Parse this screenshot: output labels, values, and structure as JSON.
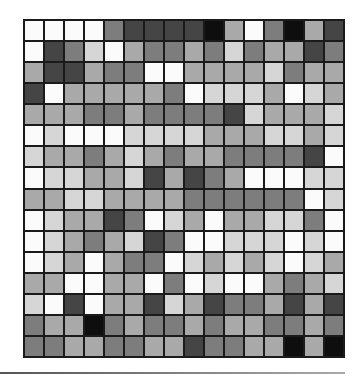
{
  "figure": {
    "rows": 16,
    "columns": 16,
    "shade_palette": [
      "#fbfbfb",
      "#d6d6d6",
      "#a9a9a9",
      "#7d7d7d",
      "#454545",
      "#0e0e0e"
    ],
    "grid_line_color": "#1a1a1a",
    "cells": [
      [
        0,
        0,
        0,
        0,
        3,
        4,
        4,
        4,
        4,
        5,
        2,
        0,
        3,
        5,
        2,
        4
      ],
      [
        0,
        4,
        3,
        1,
        0,
        2,
        3,
        3,
        2,
        3,
        1,
        3,
        2,
        2,
        4,
        3
      ],
      [
        2,
        4,
        4,
        2,
        3,
        3,
        0,
        0,
        2,
        2,
        2,
        2,
        1,
        3,
        2,
        2
      ],
      [
        4,
        0,
        2,
        2,
        2,
        2,
        2,
        3,
        0,
        1,
        1,
        1,
        2,
        0,
        1,
        2
      ],
      [
        2,
        2,
        2,
        3,
        3,
        2,
        3,
        3,
        3,
        3,
        4,
        1,
        2,
        2,
        2,
        1
      ],
      [
        0,
        1,
        0,
        0,
        0,
        1,
        1,
        1,
        1,
        2,
        2,
        2,
        1,
        1,
        2,
        1
      ],
      [
        1,
        2,
        2,
        3,
        2,
        1,
        2,
        3,
        2,
        2,
        3,
        3,
        3,
        3,
        4,
        0
      ],
      [
        0,
        1,
        1,
        2,
        2,
        1,
        4,
        2,
        4,
        3,
        2,
        0,
        0,
        0,
        1,
        1
      ],
      [
        2,
        2,
        1,
        1,
        2,
        2,
        2,
        2,
        3,
        3,
        3,
        3,
        3,
        3,
        0,
        1
      ],
      [
        0,
        1,
        2,
        2,
        4,
        3,
        0,
        1,
        2,
        0,
        2,
        2,
        1,
        1,
        3,
        0
      ],
      [
        0,
        1,
        2,
        3,
        2,
        1,
        4,
        3,
        0,
        0,
        1,
        1,
        1,
        0,
        1,
        0
      ],
      [
        0,
        1,
        2,
        0,
        2,
        3,
        3,
        0,
        1,
        2,
        1,
        2,
        1,
        0,
        1,
        2
      ],
      [
        2,
        2,
        0,
        0,
        2,
        2,
        0,
        3,
        0,
        1,
        0,
        0,
        2,
        3,
        2,
        1
      ],
      [
        1,
        0,
        4,
        0,
        2,
        2,
        4,
        1,
        2,
        4,
        3,
        3,
        2,
        4,
        2,
        4
      ],
      [
        3,
        2,
        2,
        5,
        3,
        2,
        3,
        3,
        2,
        3,
        2,
        2,
        3,
        3,
        2,
        3
      ],
      [
        3,
        3,
        2,
        2,
        3,
        3,
        2,
        2,
        4,
        3,
        3,
        2,
        2,
        5,
        2,
        5
      ]
    ]
  }
}
